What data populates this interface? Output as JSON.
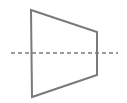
{
  "diagram": {
    "shape": "trapezoid",
    "stroke_color": "#7a7a7a",
    "axis_color": "#7a7a7a",
    "trapezoid_points": [
      [
        31,
        10
      ],
      [
        97,
        32
      ],
      [
        97,
        75
      ],
      [
        32,
        97
      ]
    ],
    "axis_line": {
      "x1": 11,
      "y1": 53,
      "x2": 118,
      "y2": 53,
      "dash": "4 3"
    }
  }
}
